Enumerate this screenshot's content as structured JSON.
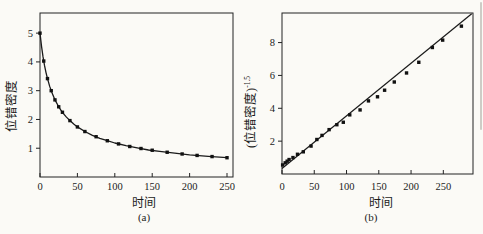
{
  "page": {
    "background": "#fbfaf6",
    "axis_color": "#222222",
    "edge_artifact_color": "#b6b4ac"
  },
  "chart_data": [
    {
      "id": "a",
      "type": "line",
      "caption": "(a)",
      "xlabel": "时间",
      "ylabel_base": "位错密度",
      "ylabel_sup": "",
      "xlim": [
        0,
        258
      ],
      "ylim": [
        0,
        5.7
      ],
      "xticks": [
        0,
        50,
        100,
        150,
        200,
        250
      ],
      "yticks": [
        1,
        2,
        3,
        4,
        5
      ],
      "line_color": "#1a1a1a",
      "marker_color": "#111111",
      "curve_points": [
        [
          0,
          5.0
        ],
        [
          2,
          4.55
        ],
        [
          4,
          4.18
        ],
        [
          6,
          3.88
        ],
        [
          8,
          3.63
        ],
        [
          10,
          3.42
        ],
        [
          13,
          3.15
        ],
        [
          16,
          2.93
        ],
        [
          20,
          2.68
        ],
        [
          25,
          2.44
        ],
        [
          30,
          2.25
        ],
        [
          35,
          2.09
        ],
        [
          40,
          1.96
        ],
        [
          45,
          1.84
        ],
        [
          50,
          1.74
        ],
        [
          60,
          1.58
        ],
        [
          70,
          1.45
        ],
        [
          80,
          1.34
        ],
        [
          90,
          1.26
        ],
        [
          100,
          1.18
        ],
        [
          115,
          1.09
        ],
        [
          130,
          1.01
        ],
        [
          145,
          0.94
        ],
        [
          160,
          0.89
        ],
        [
          180,
          0.83
        ],
        [
          200,
          0.77
        ],
        [
          225,
          0.72
        ],
        [
          250,
          0.67
        ]
      ],
      "marker_points": [
        [
          0,
          5.0
        ],
        [
          5,
          4.03
        ],
        [
          10,
          3.42
        ],
        [
          15,
          3.0
        ],
        [
          20,
          2.68
        ],
        [
          25,
          2.44
        ],
        [
          30,
          2.25
        ],
        [
          40,
          1.96
        ],
        [
          50,
          1.74
        ],
        [
          60,
          1.58
        ],
        [
          75,
          1.4
        ],
        [
          90,
          1.26
        ],
        [
          105,
          1.15
        ],
        [
          120,
          1.06
        ],
        [
          135,
          0.99
        ],
        [
          150,
          0.93
        ],
        [
          170,
          0.86
        ],
        [
          190,
          0.8
        ],
        [
          210,
          0.75
        ],
        [
          230,
          0.71
        ],
        [
          250,
          0.67
        ]
      ]
    },
    {
      "id": "b",
      "type": "scatter",
      "caption": "(b)",
      "xlabel": "时间",
      "ylabel_base": "(位错密度)",
      "ylabel_sup": "-1.5",
      "xlim": [
        0,
        296
      ],
      "ylim": [
        0,
        9.8
      ],
      "xticks": [
        0,
        50,
        100,
        150,
        200,
        250
      ],
      "yticks": [
        2,
        4,
        6,
        8
      ],
      "line_color": "#1a1a1a",
      "marker_color": "#111111",
      "fit_line": {
        "x": [
          0,
          294
        ],
        "y": [
          0.33,
          9.75
        ]
      },
      "marker_points": [
        [
          1,
          0.55
        ],
        [
          5,
          0.68
        ],
        [
          8,
          0.78
        ],
        [
          11,
          0.88
        ],
        [
          17,
          1.0
        ],
        [
          24,
          1.2
        ],
        [
          33,
          1.35
        ],
        [
          45,
          1.7
        ],
        [
          54,
          2.1
        ],
        [
          62,
          2.35
        ],
        [
          73,
          2.7
        ],
        [
          85,
          3.0
        ],
        [
          95,
          3.15
        ],
        [
          105,
          3.6
        ],
        [
          121,
          3.9
        ],
        [
          134,
          4.45
        ],
        [
          148,
          4.7
        ],
        [
          159,
          5.1
        ],
        [
          174,
          5.6
        ],
        [
          193,
          6.15
        ],
        [
          212,
          6.8
        ],
        [
          233,
          7.7
        ],
        [
          249,
          8.15
        ],
        [
          278,
          9.0
        ]
      ]
    }
  ]
}
